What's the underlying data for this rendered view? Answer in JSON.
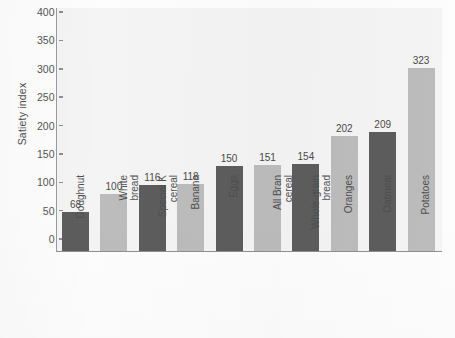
{
  "chart_data": {
    "type": "bar",
    "title": "",
    "subtitle": "",
    "xlabel": "",
    "ylabel": "Satiety index",
    "ylim": [
      0,
      430
    ],
    "yticks": [
      0,
      50,
      100,
      150,
      200,
      250,
      300,
      350,
      400
    ],
    "ytick_labels": [
      "0",
      "50",
      "100",
      "150",
      "200",
      "250",
      "300",
      "350",
      "400"
    ],
    "grid": false,
    "legend": "none",
    "categories": [
      "Doughnut",
      "White bread",
      "Special K cereal",
      "Banana",
      "Eggs",
      "All Bran cereal",
      "Whole-grain bread",
      "Oranges",
      "Oatmeal",
      "Potatoes"
    ],
    "category_label_lines": [
      [
        "Doughnut"
      ],
      [
        "White",
        "bread"
      ],
      [
        "Special K",
        "cereal"
      ],
      [
        "Banana"
      ],
      [
        "Eggs"
      ],
      [
        "All Bran",
        "cereal"
      ],
      [
        "Whole-grain",
        "bread"
      ],
      [
        "Oranges"
      ],
      [
        "Oatmeal"
      ],
      [
        "Potatoes"
      ]
    ],
    "values": [
      68,
      100,
      116,
      118,
      150,
      151,
      154,
      202,
      209,
      323
    ],
    "value_labels": [
      "68",
      "100",
      "116",
      "118",
      "150",
      "151",
      "154",
      "202",
      "209",
      "323"
    ],
    "bar_shades": [
      "dark",
      "light",
      "dark",
      "light",
      "dark",
      "light",
      "dark",
      "light",
      "dark",
      "light"
    ],
    "colors": {
      "bar_dark": "#5d5d5d",
      "bar_light": "#bcbcbc",
      "plot_background": "#f4f4f4",
      "axis_line": "#8f8f8f",
      "text": "#4f4f4f",
      "page_background": "#fdfdfd"
    }
  }
}
